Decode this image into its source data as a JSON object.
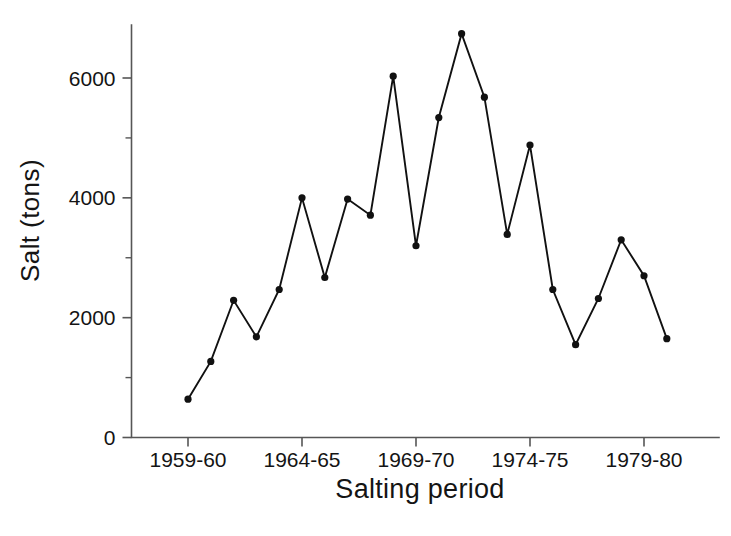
{
  "chart_data": {
    "type": "line",
    "title": "",
    "subtitle": "",
    "xlabel": "Salting period",
    "ylabel": "Salt (tons)",
    "xlim": [
      1958.2,
      1981.4
    ],
    "ylim": [
      0,
      6900
    ],
    "grid": false,
    "legend_position": "none",
    "annotations": [],
    "y_ticks_major": [
      0,
      2000,
      4000,
      6000
    ],
    "y_tick_labels": [
      "0",
      "2000",
      "4000",
      "6000"
    ],
    "y_ticks_minor": [
      1000,
      3000,
      5000
    ],
    "x_ticks_major": [
      1959,
      1964,
      1969,
      1974,
      1979
    ],
    "x_tick_labels": [
      "1959-60",
      "1964-65",
      "1969-70",
      "1974-75",
      "1979-80"
    ],
    "marker": "filled-circle",
    "series": [
      {
        "name": "Salt used",
        "x": [
          1959,
          1960,
          1961,
          1962,
          1963,
          1964,
          1965,
          1966,
          1967,
          1968,
          1969,
          1970,
          1971,
          1972,
          1973,
          1974,
          1975,
          1976,
          1977,
          1978,
          1979,
          1980
        ],
        "x_labels": [
          "1959-60",
          "1960-61",
          "1961-62",
          "1962-63",
          "1963-64",
          "1964-65",
          "1965-66",
          "1966-67",
          "1967-68",
          "1968-69",
          "1969-70",
          "1970-71",
          "1971-72",
          "1972-73",
          "1973-74",
          "1974-75",
          "1975-76",
          "1976-77",
          "1977-78",
          "1978-79",
          "1979-80",
          "1980-81"
        ],
        "values": [
          640,
          1270,
          2290,
          1680,
          2470,
          4000,
          2670,
          3980,
          3710,
          6030,
          3200,
          5340,
          6740,
          5680,
          3390,
          4880,
          2470,
          1550,
          2320,
          3300,
          2700,
          1650
        ]
      }
    ]
  },
  "axes": {
    "ylabel_text": "Salt (tons)",
    "xlabel_text": "Salting period"
  }
}
